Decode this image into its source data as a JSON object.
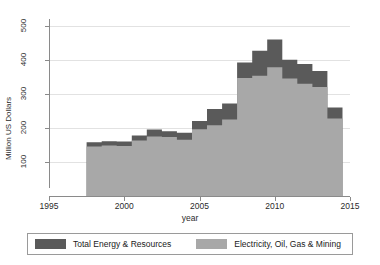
{
  "chart_data": {
    "type": "area",
    "title": "",
    "xlabel": "year",
    "ylabel": "Million US Dollars",
    "xlim": [
      1995,
      2015
    ],
    "ylim": [
      0,
      520
    ],
    "xticks": [
      1995,
      2000,
      2005,
      2010,
      2015
    ],
    "yticks": [
      100,
      200,
      300,
      400,
      500
    ],
    "grid": true,
    "legend_position": "bottom",
    "stacked": true,
    "step": true,
    "x": [
      1998,
      1999,
      2000,
      2001,
      2002,
      2003,
      2004,
      2005,
      2006,
      2007,
      2008,
      2009,
      2010,
      2011,
      2012,
      2013,
      2014
    ],
    "series": [
      {
        "name": "Electricity, Oil, Gas & Mining",
        "color": "#a8a8a8",
        "values": [
          145,
          148,
          147,
          163,
          175,
          173,
          165,
          196,
          208,
          225,
          347,
          353,
          378,
          345,
          330,
          320,
          228
        ]
      },
      {
        "name": "Total Energy & Resources",
        "color": "#5a5a5a",
        "values": [
          158,
          161,
          160,
          178,
          195,
          190,
          186,
          220,
          256,
          272,
          392,
          427,
          460,
          400,
          388,
          367,
          260
        ]
      }
    ],
    "note": "Dark band is the difference between Total Energy & Resources and Electricity, Oil, Gas & Mining"
  },
  "legend": {
    "entries": [
      {
        "label": "Total Energy & Resources",
        "color": "#5a5a5a"
      },
      {
        "label": "Electricity, Oil, Gas & Mining",
        "color": "#a8a8a8"
      }
    ]
  },
  "axes": {
    "y_title": "Million US Dollars",
    "x_title": "year",
    "y_tick_labels": [
      "100",
      "200",
      "300",
      "400",
      "500"
    ],
    "x_tick_labels": [
      "1995",
      "2000",
      "2005",
      "2010",
      "2015"
    ]
  }
}
